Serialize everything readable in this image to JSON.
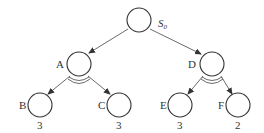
{
  "diagram": {
    "type": "and-or-tree",
    "root": {
      "label": "S",
      "subscript": "0"
    },
    "nodes": {
      "A": {
        "label": "A"
      },
      "D": {
        "label": "D"
      },
      "B": {
        "label": "B",
        "value": "3"
      },
      "C": {
        "label": "C",
        "value": "3"
      },
      "E": {
        "label": "E",
        "value": "3"
      },
      "F": {
        "label": "F",
        "value": "2"
      }
    },
    "edges": [
      {
        "from": "S0",
        "to": "A"
      },
      {
        "from": "S0",
        "to": "D"
      },
      {
        "from": "A",
        "to": "B"
      },
      {
        "from": "A",
        "to": "C"
      },
      {
        "from": "D",
        "to": "E"
      },
      {
        "from": "D",
        "to": "F"
      }
    ],
    "and_arcs": [
      "A",
      "D"
    ],
    "colors": {
      "stroke": "#333333",
      "background": "#ffffff"
    }
  }
}
